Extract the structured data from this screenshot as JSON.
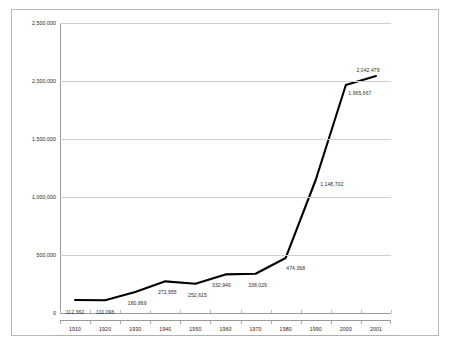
{
  "chart_data": {
    "type": "line",
    "title": "",
    "xlabel": "",
    "ylabel": "",
    "categories": [
      "1910",
      "1920",
      "1930",
      "1940",
      "1950",
      "1960",
      "1970",
      "1980",
      "1990",
      "2000",
      "2001"
    ],
    "values": [
      112362,
      110096,
      180869,
      272955,
      252615,
      332946,
      338029,
      474368,
      1148702,
      1965667,
      2042479
    ],
    "point_labels": [
      "112,362",
      "110,096",
      "180,869",
      "272,955",
      "252,615",
      "332,946",
      "338,029",
      "474,368",
      "1,148,702",
      "1,965,667",
      "2,042,479"
    ],
    "ylim": [
      0,
      2500000
    ],
    "y_ticks": [
      0,
      500000,
      1000000,
      1500000,
      2000000,
      2500000
    ],
    "y_tick_labels": [
      "0",
      "500,000",
      "1,000,000",
      "1,500,000",
      "2,000,000",
      "2,500,000"
    ],
    "x_tick_labels": [
      "1910",
      "1920",
      "1930",
      "1940",
      "1950",
      "1960",
      "1970",
      "1980",
      "1990",
      "2000",
      "2001"
    ],
    "grid": "horizontal",
    "legend": "none",
    "series_color": "#000000",
    "grid_color": "#cfcfcf",
    "axis_color": "#9a9a9a",
    "label_color": "#2b2b2b",
    "series": [
      {
        "name": "Population",
        "values": [
          112362,
          110096,
          180869,
          272955,
          252615,
          332946,
          338029,
          474368,
          1148702,
          1965667,
          2042479
        ]
      }
    ],
    "label_offsets": [
      {
        "dx": 0,
        "dy": 9
      },
      {
        "dx": 0,
        "dy": 9
      },
      {
        "dx": 2,
        "dy": 8
      },
      {
        "dx": 2,
        "dy": 8
      },
      {
        "dx": 2,
        "dy": 8
      },
      {
        "dx": -4,
        "dy": 8
      },
      {
        "dx": 2,
        "dy": 8
      },
      {
        "dx": 10,
        "dy": 7
      },
      {
        "dx": 16,
        "dy": 1
      },
      {
        "dx": 14,
        "dy": 5
      },
      {
        "dx": -8,
        "dy": -9
      }
    ]
  }
}
